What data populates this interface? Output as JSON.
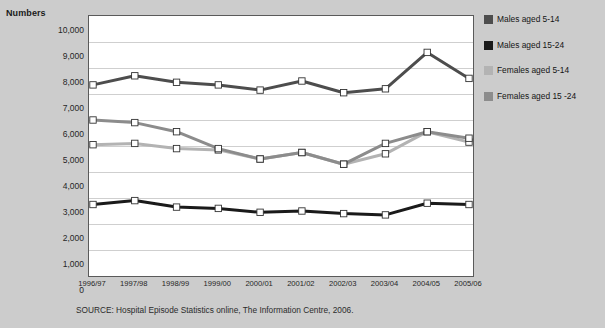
{
  "chart_data": {
    "type": "line",
    "title": "",
    "xlabel": "",
    "ylabel": "Numbers",
    "ylim": [
      0,
      10000
    ],
    "ystep": 1000,
    "grid": true,
    "legend_position": "right",
    "categories": [
      "1996/97",
      "1997/98",
      "1998/99",
      "1999/00",
      "2000/01",
      "2001/02",
      "2002/03",
      "2003/04",
      "2004/05",
      "2005/06"
    ],
    "ytick_labels": [
      "10,000",
      "9,000",
      "8,000",
      "7,000",
      "6,000",
      "5,000",
      "4,000",
      "3,000",
      "2,000",
      "1,000",
      "0"
    ],
    "series": [
      {
        "name": "Males aged 5-14",
        "color": "#4d4d4d",
        "values": [
          7350,
          7700,
          7450,
          7350,
          7150,
          7500,
          7050,
          7200,
          8600,
          7600
        ]
      },
      {
        "name": "Males aged 15-24",
        "color": "#1a1a1a",
        "values": [
          2750,
          2900,
          2650,
          2600,
          2450,
          2500,
          2400,
          2350,
          2800,
          2750
        ]
      },
      {
        "name": "Females aged 5-14",
        "color": "#b3b3b3",
        "values": [
          5050,
          5100,
          4900,
          4850,
          4500,
          4750,
          4300,
          4700,
          5550,
          5150
        ]
      },
      {
        "name": "Females aged 15 -24",
        "color": "#8c8c8c",
        "values": [
          6000,
          5900,
          5550,
          4900,
          4500,
          4750,
          4300,
          5100,
          5550,
          5300
        ]
      }
    ],
    "source": "SOURCE: Hospital Episode Statistics online, The Information Centre, 2006."
  },
  "legend": {
    "items": [
      {
        "label": "Males aged 5-14",
        "color": "#4d4d4d"
      },
      {
        "label": "Males aged 15-24",
        "color": "#1a1a1a"
      },
      {
        "label": "Females aged 5-14",
        "color": "#b3b3b3"
      },
      {
        "label": "Females aged 15 -24",
        "color": "#8c8c8c"
      }
    ]
  },
  "colors": {
    "background": "#cccccc",
    "plot_background": "#ffffff",
    "gridline": "#cfcfcf",
    "axis": "#5a5a5a",
    "marker_fill": "#ffffff",
    "marker_stroke": "#333333"
  }
}
